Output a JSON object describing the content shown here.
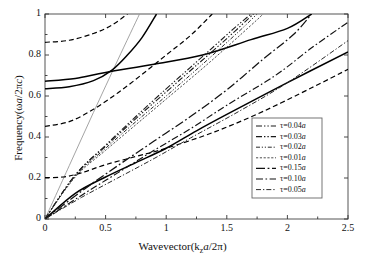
{
  "chart_data": {
    "type": "line",
    "title": "",
    "xlabel": "Wavevector(k_z a/2π)",
    "ylabel": "Frequency(ωa/2πc)",
    "xlim": [
      0,
      2.5
    ],
    "ylim": [
      0,
      1
    ],
    "xticks": [
      "0",
      "0.5",
      "1",
      "1.5",
      "2",
      "2.5"
    ],
    "yticks": [
      "0",
      "0.2",
      "0.4",
      "0.6",
      "0.8",
      "1"
    ],
    "grid": false,
    "legend_position": "lower-right",
    "series": [
      {
        "name": "τ=0.04a",
        "style": "dash-dot-dot",
        "color": "#1a1a1a",
        "points": [
          [
            0,
            0
          ],
          [
            0.25,
            0.215
          ],
          [
            0.5,
            0.36
          ],
          [
            0.75,
            0.5
          ],
          [
            1.0,
            0.635
          ],
          [
            1.2,
            0.74
          ],
          [
            1.4,
            0.845
          ],
          [
            1.55,
            0.925
          ],
          [
            1.7,
            1.0
          ]
        ]
      },
      {
        "name": "τ=0.03a",
        "style": "dash-dot-dot",
        "color": "#1a1a1a",
        "points": [
          [
            0,
            0
          ],
          [
            0.25,
            0.215
          ],
          [
            0.5,
            0.355
          ],
          [
            0.75,
            0.49
          ],
          [
            1.0,
            0.62
          ],
          [
            1.25,
            0.75
          ],
          [
            1.5,
            0.88
          ],
          [
            1.72,
            1.0
          ]
        ]
      },
      {
        "name": "τ=0.02a",
        "style": "dotted-dash",
        "color": "#2a2a2a",
        "points": [
          [
            0,
            0
          ],
          [
            0.25,
            0.21
          ],
          [
            0.5,
            0.345
          ],
          [
            0.75,
            0.475
          ],
          [
            1.0,
            0.6
          ],
          [
            1.3,
            0.755
          ],
          [
            1.6,
            0.915
          ],
          [
            1.75,
            1.0
          ]
        ]
      },
      {
        "name": "τ=0.01a",
        "style": "fine-dotted",
        "color": "#3a3a3a",
        "points": [
          [
            0,
            0
          ],
          [
            0.25,
            0.205
          ],
          [
            0.5,
            0.335
          ],
          [
            0.75,
            0.46
          ],
          [
            1.0,
            0.585
          ],
          [
            1.35,
            0.76
          ],
          [
            1.7,
            0.945
          ],
          [
            1.8,
            1.0
          ]
        ]
      },
      {
        "name": "τ=0.15a",
        "style": "long-dash-dot",
        "color": "#111111",
        "points": [
          [
            0,
            0
          ],
          [
            0.3,
            0.135
          ],
          [
            0.6,
            0.26
          ],
          [
            0.9,
            0.38
          ],
          [
            1.2,
            0.5
          ],
          [
            1.5,
            0.63
          ],
          [
            1.8,
            0.78
          ],
          [
            2.05,
            0.9
          ],
          [
            2.2,
            1.0
          ]
        ]
      },
      {
        "name": "τ=0.10a",
        "style": "dash-dot",
        "color": "#111111",
        "points": [
          [
            0,
            0
          ],
          [
            0.3,
            0.115
          ],
          [
            0.6,
            0.225
          ],
          [
            0.9,
            0.335
          ],
          [
            1.2,
            0.44
          ],
          [
            1.5,
            0.555
          ],
          [
            1.9,
            0.7
          ],
          [
            2.2,
            0.835
          ],
          [
            2.5,
            0.96
          ]
        ]
      },
      {
        "name": "τ=0.05a",
        "style": "dash-dot-fine",
        "color": "#2a2a2a",
        "points": [
          [
            0,
            0
          ],
          [
            0.3,
            0.105
          ],
          [
            0.6,
            0.2
          ],
          [
            0.9,
            0.295
          ],
          [
            1.2,
            0.395
          ],
          [
            1.6,
            0.525
          ],
          [
            2.0,
            0.665
          ],
          [
            2.5,
            0.87
          ]
        ]
      }
    ],
    "reference_curves": [
      {
        "name": "light-line",
        "style": "solid-thin-gray",
        "color": "#9a9a9a",
        "points": [
          [
            0,
            0
          ],
          [
            0.2,
            0.26
          ],
          [
            0.4,
            0.52
          ],
          [
            0.6,
            0.775
          ],
          [
            0.78,
            1.0
          ]
        ]
      },
      {
        "name": "solid-lower-band",
        "style": "solid",
        "color": "#000000",
        "points": [
          [
            0,
            0
          ],
          [
            0.25,
            0.125
          ],
          [
            0.5,
            0.205
          ],
          [
            0.75,
            0.275
          ],
          [
            1.0,
            0.345
          ],
          [
            1.25,
            0.43
          ],
          [
            1.5,
            0.51
          ],
          [
            2.0,
            0.665
          ],
          [
            2.5,
            0.815
          ]
        ]
      },
      {
        "name": "solid-upper-band-a",
        "style": "solid",
        "color": "#000000",
        "points": [
          [
            0,
            0.635
          ],
          [
            0.2,
            0.645
          ],
          [
            0.4,
            0.675
          ],
          [
            0.55,
            0.725
          ],
          [
            0.68,
            0.8
          ],
          [
            0.8,
            0.885
          ],
          [
            0.92,
            1.0
          ]
        ]
      },
      {
        "name": "solid-upper-band-b",
        "style": "solid",
        "color": "#000000",
        "points": [
          [
            0,
            0.672
          ],
          [
            0.25,
            0.685
          ],
          [
            0.5,
            0.715
          ],
          [
            0.9,
            0.755
          ],
          [
            1.3,
            0.8
          ],
          [
            1.7,
            0.875
          ],
          [
            2.0,
            0.93
          ],
          [
            2.2,
            1.0
          ]
        ]
      },
      {
        "name": "dashed-top-band",
        "style": "dashed",
        "color": "#000000",
        "points": [
          [
            0,
            0.862
          ],
          [
            0.2,
            0.872
          ],
          [
            0.4,
            0.905
          ],
          [
            0.55,
            0.945
          ],
          [
            0.68,
            1.0
          ]
        ]
      },
      {
        "name": "dashed-mid-band",
        "style": "dashed",
        "color": "#000000",
        "points": [
          [
            0,
            0.452
          ],
          [
            0.2,
            0.475
          ],
          [
            0.4,
            0.535
          ],
          [
            0.6,
            0.615
          ],
          [
            0.8,
            0.705
          ],
          [
            1.0,
            0.8
          ],
          [
            1.2,
            0.895
          ],
          [
            1.38,
            1.0
          ]
        ]
      },
      {
        "name": "dashed-low-band",
        "style": "dashed",
        "color": "#000000",
        "points": [
          [
            0,
            0.202
          ],
          [
            0.15,
            0.205
          ],
          [
            0.3,
            0.225
          ],
          [
            0.5,
            0.265
          ],
          [
            0.75,
            0.305
          ],
          [
            1.0,
            0.345
          ],
          [
            1.4,
            0.425
          ],
          [
            1.8,
            0.525
          ],
          [
            2.2,
            0.64
          ],
          [
            2.5,
            0.73
          ]
        ]
      }
    ]
  },
  "axes": {
    "xlabel_html": "Wavevector(k<sub>z</sub><i>a</i>/2π)",
    "ylabel_html": "Frequency(ω<i>a</i>/2π<i>c</i>)"
  },
  "legend": {
    "entries": [
      {
        "label": "τ=0.04a",
        "tau": "0.04"
      },
      {
        "label": "τ=0.03a",
        "tau": "0.03"
      },
      {
        "label": "τ=0.02a",
        "tau": "0.02"
      },
      {
        "label": "τ=0.01a",
        "tau": "0.01"
      },
      {
        "label": "τ=0.15a",
        "tau": "0.15"
      },
      {
        "label": "τ=0.10a",
        "tau": "0.10"
      },
      {
        "label": "τ=0.05a",
        "tau": "0.05"
      }
    ]
  }
}
